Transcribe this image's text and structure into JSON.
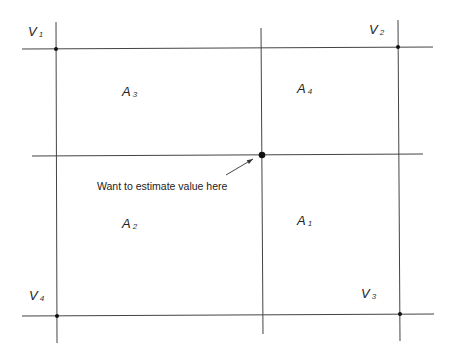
{
  "diagram": {
    "colors": {
      "line": "#444444",
      "dot": "#111111",
      "text": "#222222",
      "background": "#ffffff"
    },
    "vertices": [
      {
        "id": "V1",
        "main": "V",
        "sub": "1",
        "x": 56,
        "y": 49,
        "label_x": 28,
        "label_y": 36
      },
      {
        "id": "V2",
        "main": "V",
        "sub": "2",
        "x": 398,
        "y": 47,
        "label_x": 369,
        "label_y": 34
      },
      {
        "id": "V3",
        "main": "V",
        "sub": "3",
        "x": 400,
        "y": 314,
        "label_x": 361,
        "label_y": 298
      },
      {
        "id": "V4",
        "main": "V",
        "sub": "4",
        "x": 57,
        "y": 316,
        "label_x": 29,
        "label_y": 300
      }
    ],
    "areas": [
      {
        "id": "A1",
        "main": "A",
        "sub": "1",
        "x": 297,
        "y": 225
      },
      {
        "id": "A2",
        "main": "A",
        "sub": "2",
        "x": 122,
        "y": 228
      },
      {
        "id": "A3",
        "main": "A",
        "sub": "3",
        "x": 122,
        "y": 96
      },
      {
        "id": "A4",
        "main": "A",
        "sub": "4",
        "x": 297,
        "y": 93
      }
    ],
    "target_point": {
      "x": 262,
      "y": 155
    },
    "annotation": {
      "text": "Want to estimate value here",
      "x": 97,
      "y": 190,
      "arrow": {
        "x1": 226,
        "y1": 175,
        "x2": 253,
        "y2": 159
      }
    },
    "lines": {
      "horizontal": [
        {
          "x1": 22,
          "y1": 49,
          "x2": 433,
          "y2": 47
        },
        {
          "x1": 32,
          "y1": 156,
          "x2": 423,
          "y2": 154
        },
        {
          "x1": 22,
          "y1": 316,
          "x2": 434,
          "y2": 314
        }
      ],
      "vertical": [
        {
          "x1": 56,
          "y1": 22,
          "x2": 57,
          "y2": 343
        },
        {
          "x1": 261,
          "y1": 28,
          "x2": 263,
          "y2": 334
        },
        {
          "x1": 398,
          "y1": 20,
          "x2": 400,
          "y2": 341
        }
      ]
    }
  }
}
